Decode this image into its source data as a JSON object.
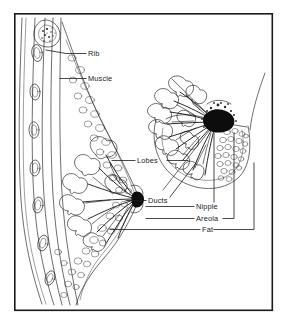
{
  "figure": {
    "background_color": "#ffffff",
    "ink_color": "#1a1a1a",
    "frame": {
      "name": "diagram-border",
      "x": 14,
      "y": 13,
      "width": 259,
      "height": 298
    },
    "views": [
      {
        "name": "lateral-cross-section",
        "description": "Side cross-section of breast showing chest wall, ribs, muscle, lobes, ducts, nipple and fat"
      },
      {
        "name": "frontal-cutaway-view",
        "description": "Frontal cutaway of breast showing radiating lobes, ducts, nipple, areola and fat"
      }
    ],
    "labels": [
      {
        "id": "rib",
        "text": "Rib",
        "x": 88,
        "y": 56,
        "leader": "line from label left edge to rib cross-section in chest wall"
      },
      {
        "id": "muscle",
        "text": "Muscle",
        "x": 88,
        "y": 81,
        "leader": "line from label left edge to pectoral muscle layer"
      },
      {
        "id": "lobes",
        "text": "Lobes",
        "x": 137,
        "y": 163,
        "leader": "lines extending left to lateral lobes and right to frontal view lobes"
      },
      {
        "id": "ducts",
        "text": "Ducts",
        "x": 148,
        "y": 203,
        "leader": "line left to duct convergence and diagonal line up-right into frontal view"
      },
      {
        "id": "nipple",
        "text": "Nipple",
        "x": 196,
        "y": 209,
        "leader": "line left to lateral nipple and vertical line up to frontal nipple"
      },
      {
        "id": "areola",
        "text": "Areola",
        "x": 196,
        "y": 221,
        "leader": "line left to lateral areola and right then up to frontal areola"
      },
      {
        "id": "fat",
        "text": "Fat",
        "x": 202,
        "y": 232,
        "leader": "line left to lateral fatty tissue and right then up to frontal fat region"
      }
    ]
  }
}
